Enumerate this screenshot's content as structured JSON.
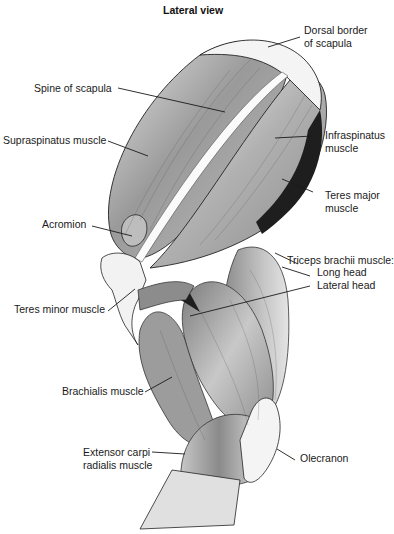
{
  "title": "Lateral view",
  "labels": {
    "dorsal_border": [
      "Dorsal border",
      "of scapula"
    ],
    "spine_of_scapula": "Spine of scapula",
    "supraspinatus": "Supraspinatus muscle",
    "infraspinatus": [
      "Infraspinatus",
      "muscle"
    ],
    "teres_major": [
      "Teres major",
      "muscle"
    ],
    "acromion": "Acromion",
    "triceps": {
      "heading": "Triceps brachii muscle:",
      "long_head": "Long head",
      "lateral_head": "Lateral head"
    },
    "teres_minor": "Teres minor muscle",
    "brachialis": "Brachialis muscle",
    "extensor_carpi": [
      "Extensor carpi",
      "radialis muscle"
    ],
    "olecranon": "Olecranon"
  },
  "colors": {
    "background": "#ffffff",
    "muscle_light": "#d6d6d6",
    "muscle_mid": "#a8a8a8",
    "muscle_dark": "#7a7a7a",
    "shadow": "#1e1e1e",
    "bone": "#f2f2f2",
    "line": "#1a1a1a"
  }
}
